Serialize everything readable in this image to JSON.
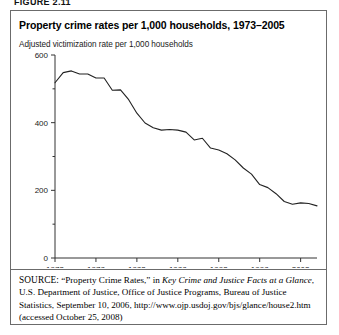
{
  "figure": {
    "label": "FIGURE 2.11"
  },
  "title": "Property crime rates per 1,000 households, 1973–2005",
  "subtitle": "Adjusted victimization rate per 1,000 households",
  "source": {
    "kicker": "SOURCE:",
    "part1": " “Property Crime Rates,” in ",
    "italic": "Key Crime and Justice Facts at a Glance",
    "part2": ", U.S. Department of Justice, Office of Justice Programs, Bureau of Justice Statistics, September 10, 2006, http://www.ojp.usdoj.gov/bjs/glance/house2.htm (accessed October 25, 2008)"
  },
  "chart_data": {
    "type": "line",
    "title": "Property crime rates per 1,000 households, 1973–2005",
    "subtitle": "Adjusted victimization rate per 1,000 households",
    "xlabel": "",
    "ylabel": "Adjusted victimization rate per 1,000 households",
    "xlim": [
      1973,
      2005
    ],
    "ylim": [
      0,
      600
    ],
    "yticks": [
      0,
      200,
      400,
      600
    ],
    "ytick_labels": [
      "0",
      "200",
      "400",
      "600"
    ],
    "yminor_ticks": [
      100,
      300,
      500
    ],
    "xticks": [
      1973,
      1978,
      1983,
      1988,
      1993,
      1998,
      2003
    ],
    "xtick_labels": [
      "1973",
      "1978",
      "1983",
      "1988",
      "1993",
      "1998",
      "2003"
    ],
    "grid": false,
    "legend": false,
    "line_color": "#222222",
    "x": [
      1973,
      1974,
      1975,
      1976,
      1977,
      1978,
      1979,
      1980,
      1981,
      1982,
      1983,
      1984,
      1985,
      1986,
      1987,
      1988,
      1989,
      1990,
      1991,
      1992,
      1993,
      1994,
      1995,
      1996,
      1997,
      1998,
      1999,
      2000,
      2001,
      2002,
      2003,
      2004,
      2005
    ],
    "values": [
      518,
      548,
      553,
      544,
      544,
      532,
      532,
      496,
      497,
      468,
      428,
      399,
      385,
      378,
      380,
      378,
      372,
      349,
      354,
      325,
      319,
      308,
      290,
      266,
      248,
      217,
      208,
      190,
      167,
      159,
      163,
      161,
      154
    ],
    "series": [
      {
        "name": "Property crime rate per 1,000 households",
        "values": [
          518,
          548,
          553,
          544,
          544,
          532,
          532,
          496,
          497,
          468,
          428,
          399,
          385,
          378,
          380,
          378,
          372,
          349,
          354,
          325,
          319,
          308,
          290,
          266,
          248,
          217,
          208,
          190,
          167,
          159,
          163,
          161,
          154
        ]
      }
    ]
  }
}
